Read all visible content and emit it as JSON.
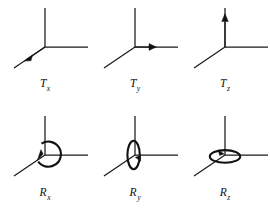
{
  "figure": {
    "background_color": "#ffffff",
    "ink_color": "#111111",
    "panel_count": 6
  },
  "panels": [
    {
      "id": "Tx",
      "label_main": "T",
      "label_sub": "x",
      "kind": "translation",
      "axis": "x",
      "motion_icon": "arrow-down-left",
      "arrow_axis": "diagonal-lower-left",
      "description": "Translation along the x axis, arrow pointing down-left along the oblique axis"
    },
    {
      "id": "Ty",
      "label_main": "T",
      "label_sub": "y",
      "kind": "translation",
      "axis": "y",
      "motion_icon": "arrow-right",
      "arrow_axis": "horizontal-right",
      "description": "Translation along the y axis, arrow pointing right along the horizontal axis"
    },
    {
      "id": "Tz",
      "label_main": "T",
      "label_sub": "z",
      "kind": "translation",
      "axis": "z",
      "motion_icon": "arrow-up",
      "arrow_axis": "vertical-up",
      "description": "Translation along the z axis, arrow pointing up along the vertical axis"
    },
    {
      "id": "Rx",
      "label_main": "R",
      "label_sub": "x",
      "kind": "rotation",
      "axis": "x",
      "motion_icon": "circle-ccw",
      "ring_orientation": "face-on-circle",
      "description": "Rotation about the x axis, circular arrow seen face-on at the origin"
    },
    {
      "id": "Ry",
      "label_main": "R",
      "label_sub": "y",
      "kind": "rotation",
      "axis": "y",
      "motion_icon": "ellipse-vertical",
      "ring_orientation": "edge-on-vertical-ellipse",
      "description": "Rotation about the y axis, narrow vertical ellipse seen edge-on"
    },
    {
      "id": "Rz",
      "label_main": "R",
      "label_sub": "z",
      "kind": "rotation",
      "axis": "z",
      "motion_icon": "ellipse-horizontal",
      "ring_orientation": "edge-on-horizontal-ellipse",
      "description": "Rotation about the z axis, flat horizontal ellipse seen edge-on"
    }
  ],
  "axes_geometry": {
    "origin": {
      "x": 45,
      "y": 47
    },
    "vertical_tip": {
      "x": 45,
      "y": 8
    },
    "horizontal_tip": {
      "x": 88,
      "y": 47
    },
    "diagonal_tip": {
      "x": 14,
      "y": 68
    }
  }
}
